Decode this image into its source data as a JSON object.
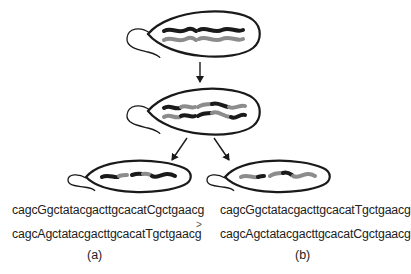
{
  "diagram": {
    "colors": {
      "outline": "#1a1a1a",
      "chromosome_dark": "#1a1a1a",
      "chromosome_light": "#8c8c8c",
      "background": "#ffffff"
    },
    "cells": [
      {
        "id": "parent",
        "strands": [
          [
            "dark",
            "dark"
          ],
          [
            "light",
            "light"
          ]
        ]
      },
      {
        "id": "recombining",
        "strands": [
          [
            "dark",
            "light",
            "dark"
          ],
          [
            "light",
            "dark",
            "light"
          ]
        ]
      },
      {
        "id": "daughter-a",
        "strands": [
          [
            "dark",
            "light",
            "dark",
            "light",
            "dark"
          ]
        ]
      },
      {
        "id": "daughter-b",
        "strands": [
          [
            "light",
            "dark",
            "light",
            "dark",
            "light"
          ]
        ]
      }
    ],
    "arrows": [
      {
        "from": "parent",
        "to": "recombining"
      },
      {
        "from": "recombining",
        "to": "daughter-a"
      },
      {
        "from": "recombining",
        "to": "daughter-b"
      }
    ]
  },
  "sequences": {
    "a": {
      "line1": "cagcGgctatacgacttgcacatCgctgaacg",
      "line2": "cagcAgctatacgacttgcacatTgctgaacg",
      "label": "(a)"
    },
    "b": {
      "line1": "cagcGgctatacgacttgcacatTgctgaacg",
      "line2": "cagcAgctatacgacttgcacatCgctgaacg",
      "label": "(b)"
    },
    "comparator": ">"
  }
}
